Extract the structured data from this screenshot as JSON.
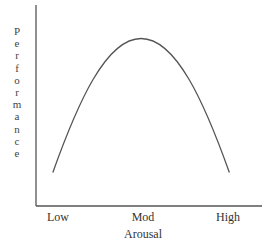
{
  "chart_data": {
    "type": "line",
    "title": "",
    "xlabel": "Arousal",
    "ylabel": "Performance",
    "x_tick_labels": [
      "Low",
      "Mod",
      "High"
    ],
    "x": [
      0,
      0.5,
      1
    ],
    "series": [
      {
        "name": "Performance",
        "shape": "inverted-U",
        "points": [
          [
            0.08,
            0.2
          ],
          [
            0.5,
            1.0
          ],
          [
            0.92,
            0.2
          ]
        ]
      }
    ],
    "xlim": [
      0,
      1
    ],
    "ylim": [
      0,
      1.2
    ],
    "grid": false,
    "legend": "none",
    "color": "#555555"
  }
}
